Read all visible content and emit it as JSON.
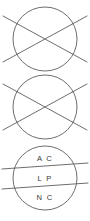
{
  "diagram": {
    "stroke_color": "#5c5c5c",
    "text_color": "#3a3a3a",
    "background_color": "#ffffff",
    "units": [
      {
        "index": 1,
        "kind": "crossed-circle",
        "label": "",
        "center_x": 45,
        "center_y": 39,
        "radius": 32
      },
      {
        "index": 2,
        "kind": "crossed-circle",
        "label": "",
        "center_x": 45,
        "center_y": 107,
        "radius": 32
      },
      {
        "index": 3,
        "kind": "banded-circle",
        "center_x": 45,
        "center_y": 178,
        "radius": 32,
        "bands": [
          {
            "index": 1,
            "label": "A C",
            "center_y": 159
          },
          {
            "index": 2,
            "label": "L P",
            "center_y": 179
          },
          {
            "index": 3,
            "label": "N C",
            "center_y": 198
          }
        ]
      }
    ]
  }
}
